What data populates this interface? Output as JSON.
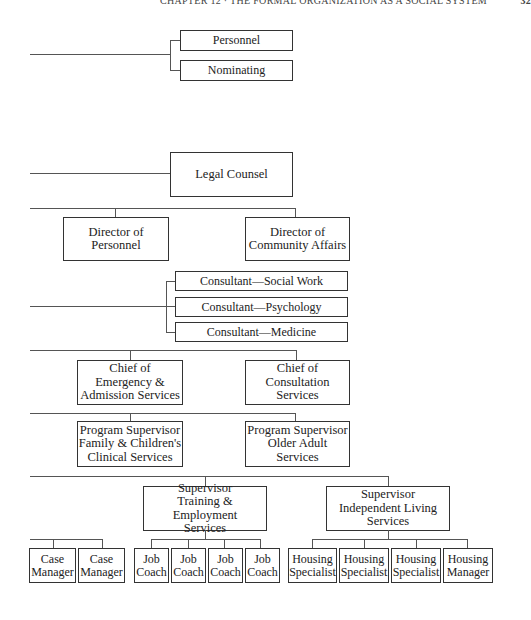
{
  "header": {
    "running_title": "CHAPTER 12 · THE FORMAL ORGANIZATION AS A SOCIAL SYSTEM",
    "page_number": "32"
  },
  "committees": {
    "personnel": "Personnel",
    "nominating": "Nominating"
  },
  "legal_counsel": "Legal Counsel",
  "directors": {
    "personnel": "Director of\nPersonnel",
    "community_affairs": "Director of\nCommunity Affairs"
  },
  "consultants": {
    "social_work": "Consultant—Social Work",
    "psychology": "Consultant—Psychology",
    "medicine": "Consultant—Medicine"
  },
  "chiefs": {
    "emergency_admission": "Chief of\nEmergency &\nAdmission Services",
    "consultation": "Chief of\nConsultation\nServices"
  },
  "program_supervisors": {
    "family_children": "Program Supervisor\nFamily & Children's\nClinical Services",
    "older_adult": "Program Supervisor\nOlder Adult\nServices"
  },
  "supervisors": {
    "training_employment": "Supervisor\nTraining & Employment\nServices",
    "independent_living": "Supervisor\nIndependent Living\nServices"
  },
  "staff": {
    "case_managers": [
      "Case\nManager",
      "Case\nManager"
    ],
    "job_coaches": [
      "Job\nCoach",
      "Job\nCoach",
      "Job\nCoach",
      "Job\nCoach"
    ],
    "housing": [
      "Housing\nSpecialist",
      "Housing\nSpecialist",
      "Housing\nSpecialist",
      "Housing\nManager"
    ]
  }
}
